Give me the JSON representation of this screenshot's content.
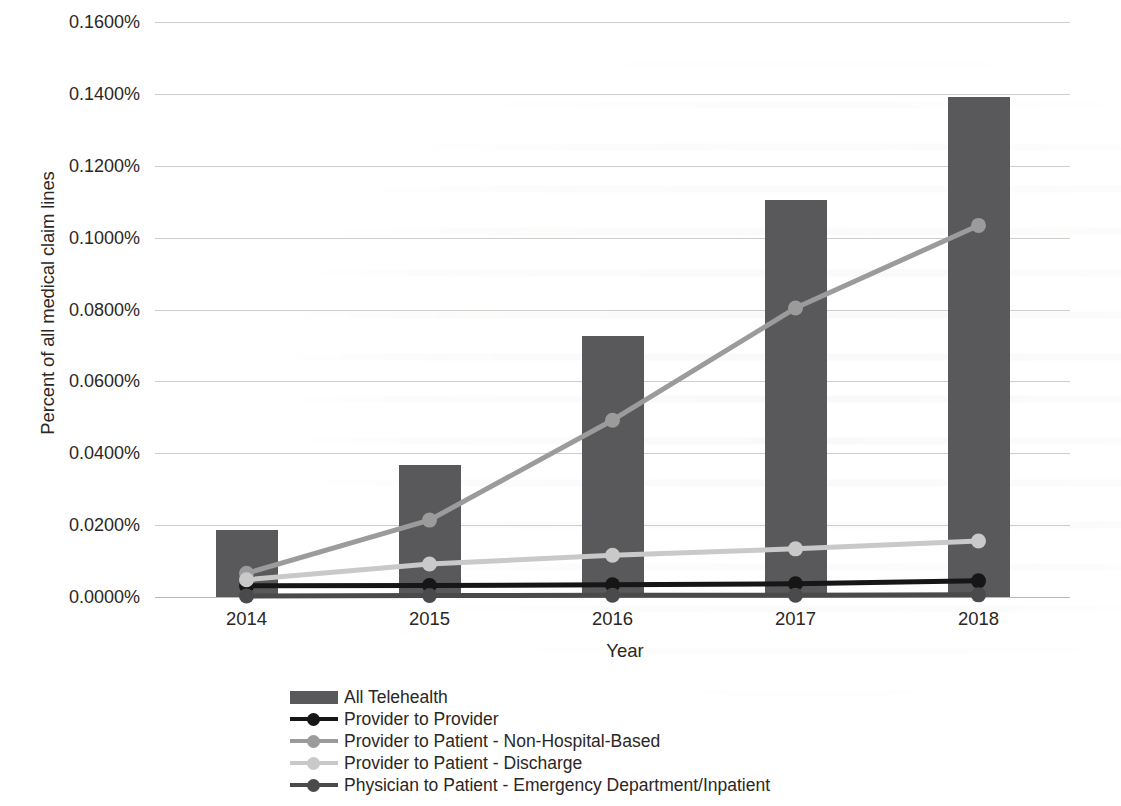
{
  "chart_data": {
    "type": "bar",
    "title": "",
    "subtitle": "",
    "xlabel": "Year",
    "ylabel": "Percent of all medical claim lines",
    "categories": [
      "2014",
      "2015",
      "2016",
      "2017",
      "2018"
    ],
    "ylim": [
      0.0,
      0.16
    ],
    "ytick_values": [
      0.0,
      0.02,
      0.04,
      0.06,
      0.08,
      0.1,
      0.12,
      0.14,
      0.16
    ],
    "ytick_labels": [
      "0.0000%",
      "0.0200%",
      "0.0400%",
      "0.0600%",
      "0.0800%",
      "0.1000%",
      "0.1200%",
      "0.1400%",
      "0.1600%"
    ],
    "grid": true,
    "legend_position": "bottom-left",
    "value_unit": "percent",
    "series": [
      {
        "name": "All Telehealth",
        "kind": "bar",
        "color": "#59595b",
        "values": [
          0.0186,
          0.0367,
          0.0727,
          0.1105,
          0.139
        ]
      },
      {
        "name": "Provider to Provider",
        "kind": "line",
        "color": "#161616",
        "values": [
          0.0031,
          0.0032,
          0.0034,
          0.0037,
          0.0045
        ]
      },
      {
        "name": "Provider to Patient - Non-Hospital-Based",
        "kind": "line",
        "color": "#9b9b9b",
        "values": [
          0.0066,
          0.0214,
          0.0492,
          0.0804,
          0.1034
        ]
      },
      {
        "name": "Provider to Patient - Discharge",
        "kind": "line",
        "color": "#c9c9c9",
        "values": [
          0.0048,
          0.0092,
          0.0116,
          0.0134,
          0.0156
        ]
      },
      {
        "name": "Physician to Patient - Emergency Department/Inpatient",
        "kind": "line",
        "color": "#4a4a4c",
        "values": [
          0.0003,
          0.0004,
          0.0005,
          0.0005,
          0.0006
        ]
      }
    ]
  }
}
